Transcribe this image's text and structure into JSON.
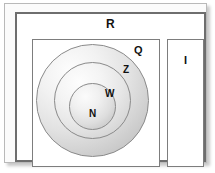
{
  "diagram": {
    "sets": {
      "real": {
        "label": "R",
        "name": "real-numbers"
      },
      "rational": {
        "label": "Q",
        "name": "rational-numbers"
      },
      "irrational": {
        "label": "I",
        "name": "irrational-numbers"
      },
      "integers": {
        "label": "Z",
        "name": "integers"
      },
      "whole": {
        "label": "W",
        "name": "whole-numbers"
      },
      "natural": {
        "label": "N",
        "name": "natural-numbers"
      }
    },
    "colors": {
      "frame_border": "#b9b9b9",
      "outer_border": "#6e6e6e",
      "inner_border": "#7d7d7d",
      "circle_border": "#8a8a8a",
      "label_text": "#111111",
      "background": "#ffffff"
    }
  }
}
